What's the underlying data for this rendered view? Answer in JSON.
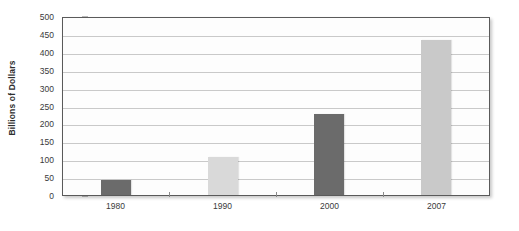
{
  "chart_data": {
    "type": "bar",
    "title": "",
    "subtitle": "",
    "xlabel": "",
    "ylabel": "Billions of Dollars",
    "categories": [
      "1980",
      "1990",
      "2000",
      "2007"
    ],
    "values": [
      43,
      105,
      225,
      432
    ],
    "bar_colors": [
      "#6b6b6b",
      "#d9d9d9",
      "#6b6b6b",
      "#c9c9c9"
    ],
    "ylim": [
      0,
      500
    ],
    "yticks": [
      0,
      50,
      100,
      150,
      200,
      250,
      300,
      350,
      400,
      450,
      500
    ],
    "ytick_labels": [
      "0",
      "50",
      "100",
      "150",
      "200",
      "250",
      "300",
      "350",
      "400",
      "450",
      "500"
    ],
    "grid": true,
    "grid_axis": "y",
    "legend": false,
    "legend_position": "none",
    "series": [
      {
        "name": "Billions of Dollars",
        "values": [
          43,
          105,
          225,
          432
        ]
      }
    ],
    "annotations": []
  },
  "style": {
    "plot_background": "#fdfdfd",
    "page_background": "#ffffff",
    "axis_color": "#5a5a5a",
    "gridline_color": "#c9c9c9",
    "text_color": "#3a3a3a"
  }
}
